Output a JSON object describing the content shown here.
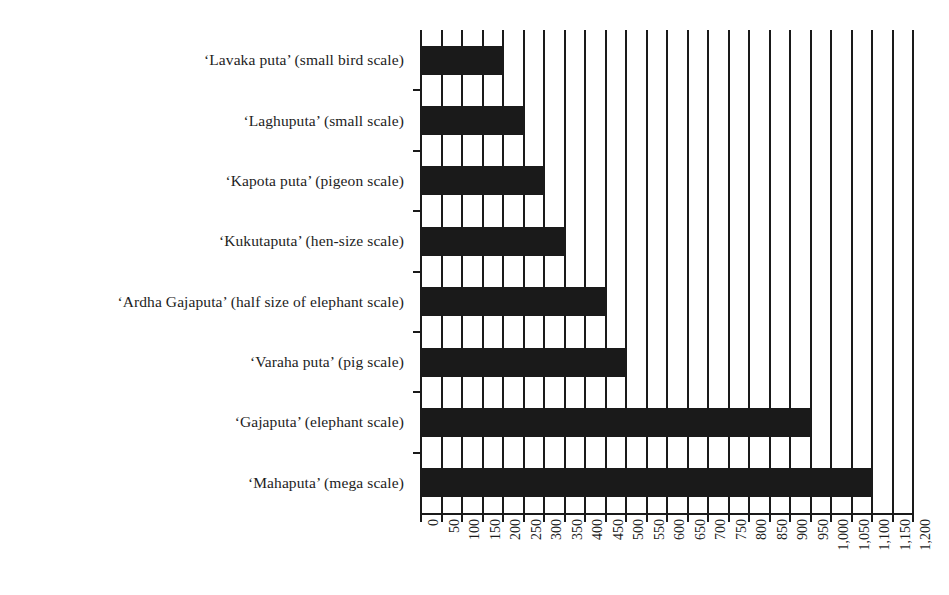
{
  "chart_data": {
    "type": "bar",
    "orientation": "horizontal",
    "title": "",
    "subtitle": "",
    "xlabel": "",
    "ylabel": "",
    "xlim": [
      0,
      1200
    ],
    "ylim": null,
    "grid": true,
    "grid_axis": "x",
    "legend": false,
    "legend_position": "none",
    "bar_color": "#1a1a1a",
    "axis_color": "#1a1a1a",
    "background": "#ffffff",
    "categories": [
      "‘Lavaka puta’ (small bird scale)",
      "‘Laghuputa’ (small scale)",
      "‘Kapota puta’ (pigeon scale)",
      "‘Kukutaputa’ (hen-size scale)",
      "‘Ardha Gajaputa’ (half size of elephant scale)",
      "‘Varaha puta’ (pig scale)",
      "‘Gajaputa’ (elephant scale)",
      "‘Mahaputa’ (mega scale)"
    ],
    "values": [
      200,
      250,
      300,
      350,
      450,
      500,
      950,
      1100
    ],
    "xticks": [
      0,
      50,
      100,
      150,
      200,
      250,
      300,
      350,
      400,
      450,
      500,
      550,
      600,
      650,
      700,
      750,
      800,
      850,
      900,
      950,
      1000,
      1050,
      1100,
      1150,
      1200
    ],
    "xtick_labels": [
      "0",
      "50",
      "100",
      "150",
      "200",
      "250",
      "300",
      "350",
      "400",
      "450",
      "500",
      "550",
      "600",
      "650",
      "700",
      "750",
      "800",
      "850",
      "900",
      "950",
      "1,000",
      "1,050",
      "1,100",
      "1,150",
      "1,200"
    ],
    "xtick_rotation": 90
  }
}
